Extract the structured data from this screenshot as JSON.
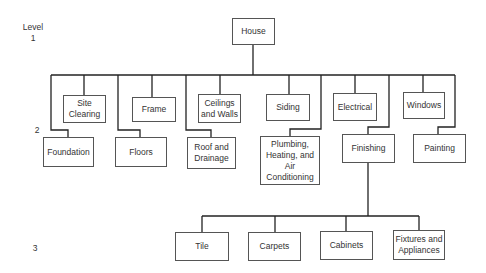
{
  "levels": {
    "title": "Level",
    "l1": "1",
    "l2": "2",
    "l3": "3"
  },
  "root": {
    "label": "House"
  },
  "level2": {
    "upper": [
      {
        "label": "Site Clearing"
      },
      {
        "label": "Frame"
      },
      {
        "label": "Ceilings and Walls"
      },
      {
        "label": "Siding"
      },
      {
        "label": "Electrical"
      },
      {
        "label": "Windows"
      }
    ],
    "lower": [
      {
        "label": "Foundation"
      },
      {
        "label": "Floors"
      },
      {
        "label": "Roof and Drainage"
      },
      {
        "label": "Plumbing, Heating, and Air Conditioning"
      },
      {
        "label": "Finishing"
      },
      {
        "label": "Painting"
      }
    ]
  },
  "level3": [
    {
      "label": "Tile"
    },
    {
      "label": "Carpets"
    },
    {
      "label": "Cabinets"
    },
    {
      "label": "Fixtures and Appliances"
    }
  ],
  "colors": {
    "line": "#222222",
    "border": "#555555",
    "text": "#333333"
  }
}
